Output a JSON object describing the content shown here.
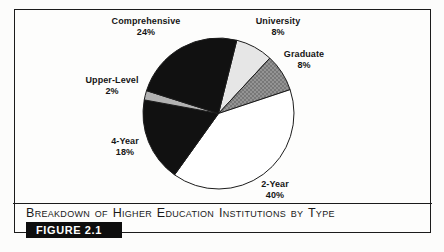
{
  "figure": {
    "caption": "Breakdown of Higher Education Institutions by Type",
    "figure_label": "FIGURE 2.1"
  },
  "chart_data": {
    "type": "pie",
    "title": "Breakdown of Higher Education Institutions by Type",
    "legend": "none",
    "labels_position": "outside",
    "start_angle_deg": 14,
    "direction": "clockwise",
    "outline_color": "#1c1c1c",
    "halftone": {
      "base": "#949494",
      "dot": "#6a6a6a"
    },
    "slices": [
      {
        "label": "University",
        "value": 8,
        "pct_label": "8%",
        "color": "#e6e6e6"
      },
      {
        "label": "Graduate",
        "value": 8,
        "pct_label": "8%",
        "color": "#8f8f8f",
        "pattern": "halftone-dots"
      },
      {
        "label": "2-Year",
        "value": 40,
        "pct_label": "40%",
        "color": "#ffffff"
      },
      {
        "label": "4-Year",
        "value": 18,
        "pct_label": "18%",
        "color": "#111111"
      },
      {
        "label": "Upper-Level",
        "value": 2,
        "pct_label": "2%",
        "color": "#b2b2b2"
      },
      {
        "label": "Comprehensive",
        "value": 24,
        "pct_label": "24%",
        "color": "#111111"
      }
    ]
  }
}
